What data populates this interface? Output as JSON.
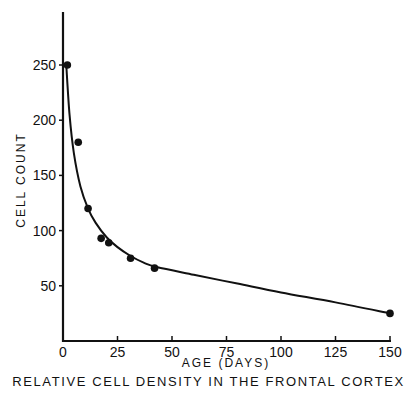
{
  "chart_data": {
    "type": "scatter",
    "title": "",
    "caption": "RELATIVE CELL DENSITY IN THE FRONTAL CORTEX",
    "xlabel": "AGE (DAYS)",
    "ylabel": "CELL COUNT",
    "xlim": [
      0,
      150
    ],
    "ylim": [
      0,
      290
    ],
    "xticks": [
      0,
      25,
      50,
      75,
      100,
      125,
      150
    ],
    "yticks": [
      50,
      100,
      150,
      200,
      250
    ],
    "grid": false,
    "legend": null,
    "series": [
      {
        "name": "observed",
        "type": "scatter",
        "x": [
          2,
          7,
          11.5,
          17.5,
          21,
          31,
          42,
          150
        ],
        "y": [
          250,
          180,
          120,
          93,
          89,
          75,
          66,
          25
        ]
      },
      {
        "name": "fitted curve",
        "type": "line",
        "x": [
          1.5,
          3,
          5,
          8,
          11.5,
          15,
          20,
          25,
          31,
          37,
          43,
          60,
          80,
          100,
          125,
          150
        ],
        "y": [
          250,
          205,
          170,
          140,
          120,
          107,
          94,
          85,
          77,
          71,
          67,
          60,
          52,
          44,
          35,
          25
        ]
      }
    ]
  },
  "labels": {
    "xlabel": "AGE (DAYS)",
    "ylabel": "CELL COUNT",
    "caption": "RELATIVE CELL DENSITY IN THE FRONTAL CORTEX"
  }
}
